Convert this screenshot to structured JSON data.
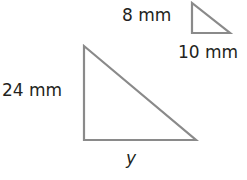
{
  "small_triangle": {
    "vertical_label": "8 mm",
    "horizontal_label": "10 mm",
    "points": [
      [
        192,
        3
      ],
      [
        192,
        33
      ],
      [
        230,
        33
      ]
    ]
  },
  "large_triangle": {
    "vertical_label": "24 mm",
    "horizontal_label": "y",
    "points": [
      [
        84,
        46
      ],
      [
        84,
        140
      ],
      [
        196,
        140
      ]
    ]
  },
  "colors": {
    "stroke": "#8a8a8a",
    "text": "#231f20"
  }
}
